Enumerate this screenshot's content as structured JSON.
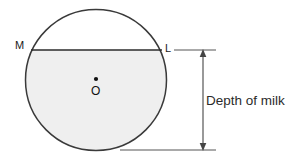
{
  "figure": {
    "labels": {
      "point_m": "M",
      "point_l": "L",
      "center": "O",
      "dimension": "Depth of milk"
    },
    "colors": {
      "stroke": "#3a3a3a",
      "chord_stroke": "#2b2b2b",
      "milk_fill": "#efefef",
      "air_fill": "#ffffff",
      "dimension_line": "#555555",
      "text": "#1a1a1a",
      "background": "#ffffff"
    },
    "geometry": {
      "circle_center_x": 96,
      "circle_center_y": 80,
      "circle_radius": 70.5,
      "chord_y": 50,
      "chord_x_start": 31,
      "chord_x_end": 162,
      "dimension_x": 203,
      "dimension_top_y": 50,
      "dimension_bottom_y": 150,
      "tick_top_x_start": 174,
      "tick_top_x_end": 216,
      "tick_bottom_x_start": 120,
      "tick_bottom_x_end": 216,
      "center_dot_x": 96,
      "center_dot_y": 79,
      "center_dot_radius": 2.1
    }
  }
}
